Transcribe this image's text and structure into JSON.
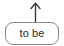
{
  "canvas": {
    "width": 64,
    "height": 46,
    "background": "#ffffff"
  },
  "diagram": {
    "node": {
      "label": "to be",
      "shape": "rounded-rectangle",
      "border_color": "#8a8a8a",
      "fill_color": "#ffffff",
      "text_color": "#2b2b2b"
    },
    "connector": {
      "icon": "up-arrow-icon",
      "direction": "up",
      "color": "#3a3a3a"
    }
  }
}
